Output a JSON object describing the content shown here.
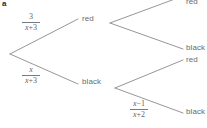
{
  "diagram": {
    "type": "probability-tree",
    "title": "",
    "corner_mark": "a",
    "line_color": "#8a8a8a",
    "text_color": "#6b6b6b",
    "background": "#ffffff",
    "root": {
      "name": "root",
      "x": 10,
      "y": 54
    },
    "branches": [
      {
        "id": "branch-red-1",
        "from": "root",
        "to": "node-red-1",
        "probability": {
          "numerator": "3",
          "denominator_var": "x",
          "denominator_op": "+",
          "denominator_const": "3",
          "display": "3/(x + 3)"
        }
      },
      {
        "id": "branch-black-1",
        "from": "root",
        "to": "node-black-1",
        "probability": {
          "numerator": "x",
          "denominator_var": "x",
          "denominator_op": "+",
          "denominator_const": "3",
          "display": "x/(x + 3)"
        }
      },
      {
        "id": "branch-red-1-red-2",
        "from": "node-red-1",
        "to": "leaf-red-top",
        "probability": {
          "display": ""
        }
      },
      {
        "id": "branch-red-1-black-2",
        "from": "node-red-1",
        "to": "leaf-black-upper",
        "probability": {
          "display": ""
        }
      },
      {
        "id": "branch-black-1-red-2",
        "from": "node-black-1",
        "to": "leaf-red-lower",
        "probability": {
          "display": ""
        }
      },
      {
        "id": "branch-black-1-black-2",
        "from": "node-black-1",
        "to": "leaf-black-bottom",
        "probability": {
          "numerator_var": "x",
          "numerator_op": "−",
          "numerator_const": "1",
          "denominator_var": "x",
          "denominator_op": "+",
          "denominator_const": "2",
          "display": "(x − 1)/(x + 2)"
        }
      }
    ],
    "nodes": [
      {
        "id": "node-red-1",
        "label": "red",
        "x": 82,
        "y": 18
      },
      {
        "id": "node-black-1",
        "label": "black",
        "x": 82,
        "y": 81
      }
    ],
    "leaves": [
      {
        "id": "leaf-red-top",
        "label": "red",
        "x": 186,
        "y": -1
      },
      {
        "id": "leaf-black-upper",
        "label": "black",
        "x": 186,
        "y": 45
      },
      {
        "id": "leaf-red-lower",
        "label": "red",
        "x": 186,
        "y": 58
      },
      {
        "id": "leaf-black-bottom",
        "label": "black",
        "x": 186,
        "y": 109
      }
    ],
    "fractions": [
      {
        "id": "frac-top-left",
        "num": "3",
        "den_var": "x",
        "den_op": "+",
        "den_const": "3",
        "x": 22,
        "y": 13
      },
      {
        "id": "frac-bottom-left",
        "num": "x",
        "den_var": "x",
        "den_op": "+",
        "den_const": "3",
        "x": 22,
        "y": 66
      },
      {
        "id": "frac-bottom-right",
        "num_var": "x",
        "num_op": "−",
        "num_const": "1",
        "den_var": "x",
        "den_op": "+",
        "den_const": "2",
        "x": 130,
        "y": 100
      }
    ]
  }
}
